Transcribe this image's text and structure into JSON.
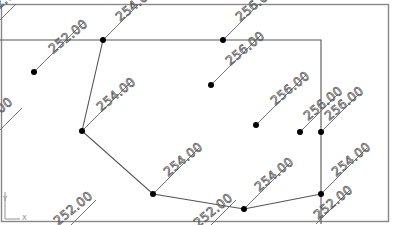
{
  "viewport": {
    "type": "cad-drawing-viewport",
    "ucs_icon": {
      "x_label": "X",
      "y_label": "Y"
    }
  },
  "points": [
    {
      "id": "p1",
      "x": 34,
      "y": 72,
      "label": "252.00"
    },
    {
      "id": "p2",
      "x": 103,
      "y": 40,
      "label": "254.00"
    },
    {
      "id": "p3",
      "x": 223,
      "y": 40,
      "label": "256.00"
    },
    {
      "id": "p4",
      "x": 211,
      "y": 85,
      "label": "256.00"
    },
    {
      "id": "p5",
      "x": 82,
      "y": 131,
      "label": "254.00"
    },
    {
      "id": "p6",
      "x": 256,
      "y": 125,
      "label": "256.00"
    },
    {
      "id": "p7",
      "x": 300,
      "y": 132,
      "label": "256.00"
    },
    {
      "id": "p8",
      "x": 321,
      "y": 132,
      "label": "256.00"
    },
    {
      "id": "p9",
      "x": 153,
      "y": 194,
      "label": "254.00"
    },
    {
      "id": "p10",
      "x": 244,
      "y": 209,
      "label": "254.00"
    },
    {
      "id": "p11",
      "x": 321,
      "y": 194,
      "label": "254.00"
    }
  ],
  "labels": {
    "l_top_left": "252.00",
    "l_left_mid": "252.00",
    "l_bottom_left": "252.00",
    "l_bottom_mid": "252.00",
    "l_bottom_right": "252.00",
    "l_p1": "252.00",
    "l_p2": "254.00",
    "l_p3": "256.00",
    "l_p4": "256.00",
    "l_p5": "254.00",
    "l_p6": "256.00",
    "l_p7": "256.00",
    "l_p8": "256.00",
    "l_p9": "254.00",
    "l_p10": "254.00",
    "l_p11": "254.00"
  },
  "ucs": {
    "x": "X",
    "y": "Y"
  }
}
